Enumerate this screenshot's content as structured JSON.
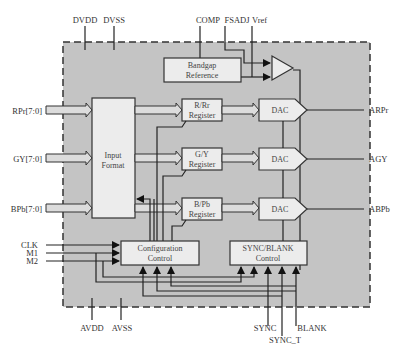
{
  "colors": {
    "chip_fill": "#c4c4c4",
    "block_fill": "#ececec",
    "line": "#222222",
    "text": "#333333"
  },
  "pins_top": {
    "dvdd": "DVDD",
    "dvss": "DVSS",
    "comp": "COMP",
    "fsadj": "FSADJ",
    "vref": "Vref"
  },
  "pins_left": {
    "rpr": "RPr[7:0]",
    "gy": "GY[7:0]",
    "bpb": "BPb[7:0]",
    "clk": "CLK",
    "m1": "M1",
    "m2": "M2"
  },
  "pins_right": {
    "arpr": "ARPr",
    "agy": "AGY",
    "abpb": "ABPb"
  },
  "pins_bottom": {
    "avdd": "AVDD",
    "avss": "AVSS",
    "sync": "SYNC",
    "sync_t": "SYNC_T",
    "blank": "BLANK"
  },
  "blocks": {
    "bandgap": [
      "Bandgap",
      "Reference"
    ],
    "input_format": [
      "Input",
      "Format"
    ],
    "reg_r": [
      "R/Rr",
      "Register"
    ],
    "reg_g": [
      "G/Y",
      "Register"
    ],
    "reg_b": [
      "B/Pb",
      "Register"
    ],
    "dac": "DAC",
    "config": [
      "Configuration",
      "Control"
    ],
    "syncblank": [
      "SYNC/BLANK",
      "Control"
    ]
  }
}
